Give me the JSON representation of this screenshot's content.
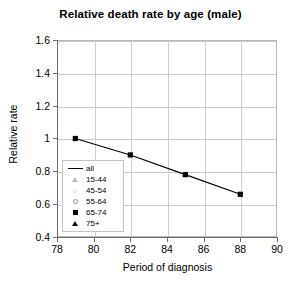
{
  "chart_data": {
    "type": "line",
    "title": "Relative death rate by age (male)",
    "xlabel": "Period of diagnosis",
    "ylabel": "Relative rate",
    "xlim": [
      78,
      90
    ],
    "ylim": [
      0.4,
      1.6
    ],
    "xticks": [
      "78",
      "80",
      "82",
      "84",
      "86",
      "88",
      "90"
    ],
    "yticks": [
      "1.6",
      "1.4",
      "1.2",
      "1",
      "0.8",
      "0.6",
      "0.4"
    ],
    "grid": "both",
    "legend_position": "inside-left",
    "x": [
      79,
      82,
      85,
      88
    ],
    "series": [
      {
        "name": "65-74",
        "marker": "filled-square",
        "values": [
          1.0,
          0.9,
          0.78,
          0.66
        ]
      }
    ]
  },
  "legend": {
    "items": [
      {
        "label": "all",
        "key": "line-key"
      },
      {
        "label": "15-44",
        "key": "open-triangle-key"
      },
      {
        "label": "45-54",
        "key": "faint-circle-key"
      },
      {
        "label": "55-64",
        "key": "open-circle-key"
      },
      {
        "label": "65-74",
        "key": "filled-square-key"
      },
      {
        "label": "75+",
        "key": "filled-triangle-key"
      }
    ]
  },
  "colors": {
    "series": "#000000",
    "grid": "#c9c9c9",
    "axis": "#6d6d6d",
    "background": "#ffffff"
  }
}
